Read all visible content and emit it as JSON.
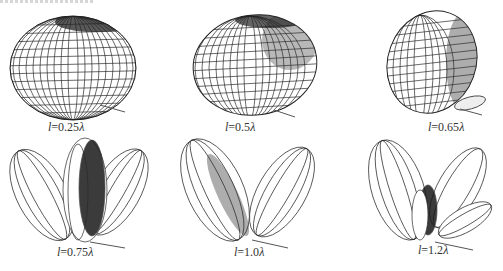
{
  "figure": {
    "panels": [
      {
        "id": "p1",
        "variable": "l",
        "eq": "=0.25",
        "unit": "λ",
        "label": "l=0.25λ",
        "pattern": "single-lobe ellipsoid"
      },
      {
        "id": "p2",
        "variable": "l",
        "eq": "=0.5",
        "unit": "λ",
        "label": "l=0.5λ",
        "pattern": "single-lobe ellipsoid (narrower)"
      },
      {
        "id": "p3",
        "variable": "l",
        "eq": "=0.65",
        "unit": "λ",
        "label": "l=0.65λ",
        "pattern": "main lobe with small side lobe"
      },
      {
        "id": "p4",
        "variable": "l",
        "eq": "=0.75",
        "unit": "λ",
        "label": "l=0.75λ",
        "pattern": "three lobes"
      },
      {
        "id": "p5",
        "variable": "l",
        "eq": "=1.0",
        "unit": "λ",
        "label": "l=1.0λ",
        "pattern": "two lobes"
      },
      {
        "id": "p6",
        "variable": "l",
        "eq": "=1.2",
        "unit": "λ",
        "label": "l=1.2λ",
        "pattern": "four lobes"
      }
    ]
  },
  "colors": {
    "line": "#2a2a2a",
    "dense": "#111111",
    "background": "#ffffff"
  }
}
